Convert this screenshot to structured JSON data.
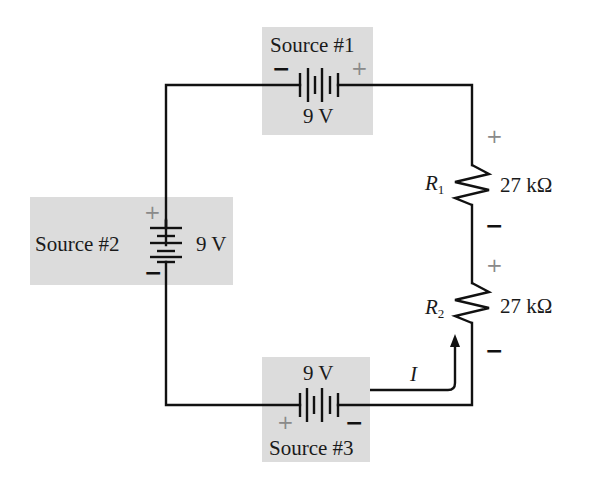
{
  "diagram": {
    "type": "series circuit",
    "colors": {
      "wire": "#111111",
      "source_box": "#dcdcdc",
      "plus_sign": "#8a8a8a",
      "minus_sign": "#111111"
    },
    "sources": [
      {
        "id": 1,
        "label": "Source #1",
        "voltage": "9 V",
        "left_terminal": "−",
        "right_terminal": "+"
      },
      {
        "id": 2,
        "label": "Source #2",
        "voltage": "9 V",
        "top_terminal": "+",
        "bottom_terminal": "−"
      },
      {
        "id": 3,
        "label": "Source #3",
        "voltage": "9 V",
        "left_terminal": "+",
        "right_terminal": "−"
      }
    ],
    "resistors": [
      {
        "name": "R",
        "subscript": "1",
        "value": "27 kΩ",
        "top_terminal": "+",
        "bottom_terminal": "−"
      },
      {
        "name": "R",
        "subscript": "2",
        "value": "27 kΩ",
        "top_terminal": "+",
        "bottom_terminal": "−"
      }
    ],
    "current": {
      "label": "I"
    }
  }
}
